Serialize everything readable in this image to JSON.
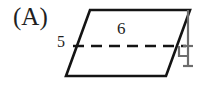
{
  "figure": {
    "choice_label": "(A)",
    "shape_name": "parallelogram",
    "stroke_color": "#141414",
    "background_color": "#ffffff",
    "labels": {
      "side_length": "5",
      "base_length": "6"
    },
    "markers": {
      "right_angle": "right-angle-marker",
      "height_line_style": "dashed"
    },
    "geometry": {
      "top_left": [
        90,
        10
      ],
      "top_right": [
        190,
        10
      ],
      "bottom_right": [
        166,
        76
      ],
      "bottom_left": [
        66,
        76
      ],
      "dashed_line_start": [
        73,
        46
      ],
      "dashed_line_end": [
        186,
        46
      ],
      "height_line_top": [
        188,
        10
      ],
      "height_line_bottom": [
        188,
        66
      ]
    }
  }
}
